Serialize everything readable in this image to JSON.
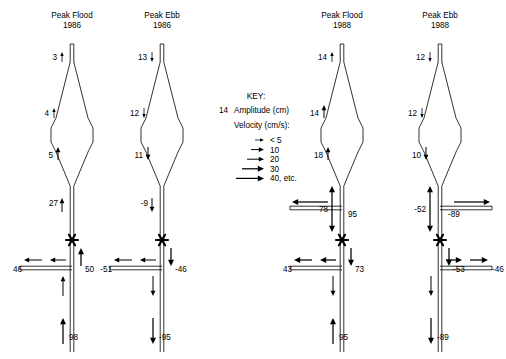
{
  "figure": {
    "type": "estuary-tidal-flow-diagram",
    "background": "#ffffff",
    "ink": "#000000"
  },
  "key": {
    "title": "KEY:",
    "amplitude_value": "14",
    "amplitude_label": "Amplitude (cm)",
    "velocity_label": "Velocity (cm/s):",
    "velocity_scale": [
      {
        "label": "< 5",
        "len": 9
      },
      {
        "label": "10",
        "len": 13
      },
      {
        "label": "20",
        "len": 17
      },
      {
        "label": "30",
        "len": 22
      },
      {
        "label": "40, etc.",
        "len": 28
      }
    ]
  },
  "panels": [
    {
      "id": "peak-flood-1986",
      "title_line1": "Peak Flood",
      "title_line2": "1986",
      "basin_labels": [
        {
          "value": "3",
          "dir": "up",
          "weight": 1
        },
        {
          "value": "4",
          "dir": "up",
          "weight": 1
        },
        {
          "value": "5",
          "dir": "up",
          "weight": 2
        }
      ],
      "channel_labels": [
        {
          "value": "27",
          "dir": "up",
          "weight": 2
        },
        {
          "value": "50",
          "dir": "up",
          "weight": 3
        },
        {
          "value": "98",
          "dir": "up",
          "weight": 3
        }
      ],
      "branch_labels": [
        {
          "value": "46",
          "dir": "left",
          "weight": 2
        }
      ],
      "has_upper_branch": false
    },
    {
      "id": "peak-ebb-1986",
      "title_line1": "Peak Ebb",
      "title_line2": "1986",
      "basin_labels": [
        {
          "value": "13",
          "dir": "down",
          "weight": 1
        },
        {
          "value": "12",
          "dir": "down",
          "weight": 1
        },
        {
          "value": "11",
          "dir": "down",
          "weight": 2
        }
      ],
      "channel_labels": [
        {
          "value": "-9",
          "dir": "down",
          "weight": 2
        },
        {
          "value": "-46",
          "dir": "down",
          "weight": 3
        },
        {
          "value": "-95",
          "dir": "down",
          "weight": 3
        }
      ],
      "branch_labels": [
        {
          "value": "-51",
          "dir": "left",
          "weight": 2
        }
      ],
      "has_upper_branch": false
    },
    {
      "id": "peak-flood-1988",
      "title_line1": "Peak Flood",
      "title_line2": "1988",
      "basin_labels": [
        {
          "value": "14",
          "dir": "up",
          "weight": 1
        },
        {
          "value": "14",
          "dir": "up",
          "weight": 2
        },
        {
          "value": "18",
          "dir": "up",
          "weight": 2
        }
      ],
      "channel_labels": [
        {
          "value": "78",
          "dir": "both",
          "weight": 3
        },
        {
          "value": "73",
          "dir": "down",
          "weight": 3
        },
        {
          "value": "95",
          "dir": "up",
          "weight": 3
        }
      ],
      "branch_labels": [
        {
          "value": "43",
          "dir": "left",
          "weight": 3
        }
      ],
      "upper_branch": {
        "value": "95",
        "dir": "left",
        "weight": 3
      },
      "has_upper_branch": true
    },
    {
      "id": "peak-ebb-1988",
      "title_line1": "Peak Ebb",
      "title_line2": "1988",
      "basin_labels": [
        {
          "value": "12",
          "dir": "down",
          "weight": 1
        },
        {
          "value": "12",
          "dir": "down",
          "weight": 1
        },
        {
          "value": "10",
          "dir": "down",
          "weight": 2
        }
      ],
      "channel_labels": [
        {
          "value": "-52",
          "dir": "both",
          "weight": 3
        },
        {
          "value": "-53",
          "dir": "down",
          "weight": 3
        },
        {
          "value": "-89",
          "dir": "down",
          "weight": 3
        }
      ],
      "branch_labels": [
        {
          "value": "-46",
          "dir": "right",
          "weight": 3
        }
      ],
      "upper_branch": {
        "value": "-89",
        "dir": "right",
        "weight": 3
      },
      "has_upper_branch": true
    }
  ]
}
